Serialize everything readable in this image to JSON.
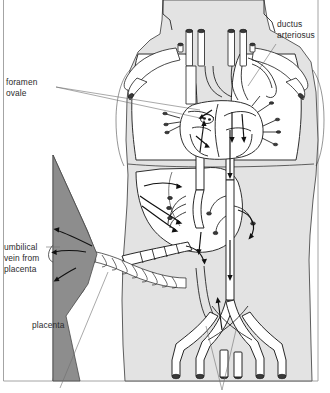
{
  "figure": {
    "type": "anatomical-diagram",
    "frame": {
      "visible": true,
      "color": "#9a9a9a"
    },
    "colors": {
      "body_fill": "#e3e3e3",
      "organ_white": "#ffffff",
      "placenta_gray": "#8d8d8d",
      "vessel_outline": "#1c1c1c",
      "label_text": "#2b2b2b",
      "leader_line": "#6f6f6f",
      "background": "#ffffff"
    }
  },
  "labels": [
    {
      "id": "ductus-arteriosus",
      "text_lines": [
        "ductus",
        "arteriosus"
      ],
      "line1": "ductus",
      "line2": "arteriosus",
      "position": "top-right",
      "has_leader": true
    },
    {
      "id": "foramen-ovale",
      "text_lines": [
        "foramen",
        "ovale"
      ],
      "line1": "foramen",
      "line2": "ovale",
      "position": "upper-left",
      "has_leader": true
    },
    {
      "id": "umbilical-vein-from-placenta",
      "text_lines": [
        "umbilical",
        "vein from",
        "placenta"
      ],
      "line1": "umbilical",
      "line2": "vein from",
      "line3": "placenta",
      "position": "mid-left",
      "has_leader": true
    },
    {
      "id": "placenta",
      "text_lines": [
        "placenta"
      ],
      "line1": "placenta",
      "position": "lower-left",
      "has_leader": false
    }
  ],
  "structures": [
    {
      "id": "fetus-body",
      "name": "fetal body silhouette"
    },
    {
      "id": "lungs",
      "name": "lungs"
    },
    {
      "id": "heart",
      "name": "heart"
    },
    {
      "id": "liver",
      "name": "liver"
    },
    {
      "id": "placenta",
      "name": "placenta"
    },
    {
      "id": "umbilical-cord",
      "name": "umbilical cord"
    },
    {
      "id": "aorta",
      "name": "descending aorta"
    },
    {
      "id": "iliac-vessels",
      "name": "iliac vessels"
    },
    {
      "id": "neck-vessels",
      "name": "neck vessels"
    },
    {
      "id": "arm-vessels",
      "name": "arm vessels"
    }
  ],
  "cut_leaders_bottom": 3
}
